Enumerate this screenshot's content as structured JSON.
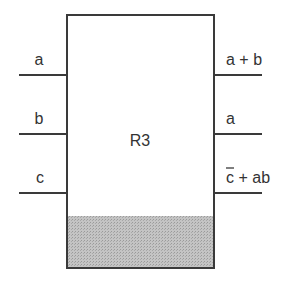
{
  "block": {
    "name": "R3",
    "shade_color": "#bdbdbd",
    "line_color": "#3a3a3a"
  },
  "inputs": [
    {
      "label": "a"
    },
    {
      "label": "b"
    },
    {
      "label": "c"
    }
  ],
  "outputs": [
    {
      "label": "a + b"
    },
    {
      "label": "a"
    },
    {
      "label_overbar": "c",
      "label_rest": " + ab"
    }
  ]
}
